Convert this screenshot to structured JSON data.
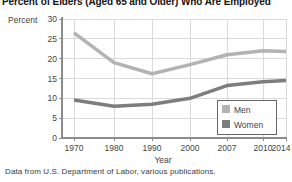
{
  "chart": {
    "title": "Percent of Elders (Aged 65 and Older) Who Are Employed",
    "caption": "Data from U.S. Department of Labor, various publications.",
    "colors": {
      "title_text": "#151515",
      "axis_line": "#8c8c8c",
      "grid_line": "#dadada",
      "tick_text": "#444444",
      "legend_border": "#666666",
      "legend_bg": "#ffffff",
      "caption_text": "#3c3c3c"
    }
  },
  "chart_data": {
    "type": "line",
    "title": "Percent of Elders (Aged 65 and Older) Who Are Employed",
    "xlabel": "Year",
    "ylabel": "Percent",
    "categories": [
      "1970",
      "1980",
      "1990",
      "2000",
      "2007",
      "2010",
      "2014"
    ],
    "series": [
      {
        "name": "Men",
        "color": "#b3b3b3",
        "values": [
          26.5,
          19.0,
          16.2,
          18.5,
          21.0,
          22.0,
          21.8
        ]
      },
      {
        "name": "Women",
        "color": "#7d7d7d",
        "values": [
          9.6,
          8.0,
          8.5,
          10.0,
          13.2,
          14.2,
          14.5
        ]
      }
    ],
    "ylim": [
      0,
      30
    ],
    "ytick_step": 5,
    "grid": true,
    "legend_position": "bottom-right"
  }
}
